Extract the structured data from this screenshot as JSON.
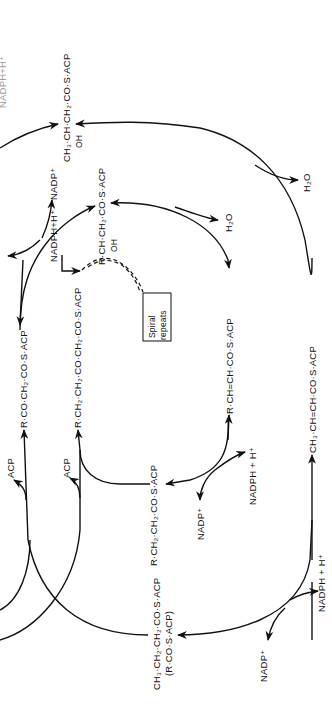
{
  "diagram": {
    "orientation": "rotated -90deg",
    "colors": {
      "ink": "#111111",
      "background": "#ffffff"
    },
    "cut_off_label": "NADPH+H⁺",
    "compounds": {
      "butyryl": "CH₃·CH₂·CH₂·CO·S·ACP",
      "butyryl_alias": "(R·CO·S·ACP)",
      "crotonyl": "CH₃·CH=CH·CO·S·ACP",
      "hydroxybutyryl": "CH₃·CH·CH₂·CO·S·ACP",
      "hydroxybutyryl_oh": "OH",
      "ketoacyl": "R·CO·CH₂·CO·S·ACP",
      "ketoacyl_chain": "R·CH₂·CH₂·CO·CH₂·CO·S·ACP",
      "acyl": "R·CH₂·CH₂·CO·S·ACP",
      "enoyl": "R·CH=CH·CO·S·ACP",
      "hydroxyacyl": "R·CH·CH₂·CO·S·ACP",
      "hydroxyacyl_oh": "OH"
    },
    "cofactors": {
      "nadp_bottom": "NADP⁺",
      "nadph_bottom": "NADPH + H⁺",
      "nadp_mid": "NADP⁺",
      "nadph_mid": "NADPH + H⁺",
      "nadp_top": "NADP⁺",
      "nadph_top": "NADPH+H⁺",
      "nadph_spiral": "NADPH+H⁺",
      "h2o_outer": "H₂O",
      "h2o_inner": "H₂O",
      "acp_outer": "ACP",
      "acp_inner": "ACP"
    },
    "spiral_box": {
      "line1": "Spiral",
      "line2": "repeats"
    }
  }
}
